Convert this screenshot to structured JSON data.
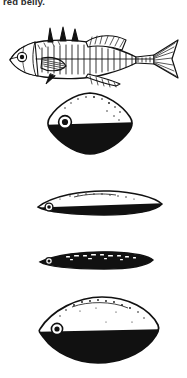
{
  "page": {
    "background_color": "#ffffff",
    "ink_color": "#111111",
    "width": 187,
    "height": 378
  },
  "caption": {
    "text": "red belly.",
    "clipped_at_top": true
  },
  "figure": {
    "panels": [
      {
        "id": "fish-lateral-view",
        "name": "stickleback-lateral-illustration",
        "label": "",
        "style": "line-art",
        "features": [
          "eye",
          "gill-cover",
          "pectoral-fin",
          "dorsal-spines",
          "lateral-scutes",
          "anal-fin",
          "caudal-peduncle-keel",
          "forked-caudal-fin"
        ]
      },
      {
        "id": "body-form-1",
        "name": "rounded-diamond-cross-section",
        "label": "",
        "shape": "rounded-rhomboid",
        "upper_tone": "white",
        "lower_tone": "black",
        "has_eye": true
      },
      {
        "id": "body-form-2",
        "name": "flattened-oval-cross-section",
        "label": "",
        "shape": "flattened-ellipse",
        "upper_tone": "white",
        "lower_tone": "black",
        "has_eye": true
      },
      {
        "id": "body-form-3",
        "name": "slender-dark-cross-section",
        "label": "",
        "shape": "slender-spindle",
        "upper_tone": "black",
        "lower_tone": "black",
        "has_eye": true
      },
      {
        "id": "body-form-4",
        "name": "pointed-lens-cross-section",
        "label": "",
        "shape": "pointed-lens",
        "upper_tone": "white",
        "lower_tone": "black",
        "has_eye": true
      }
    ]
  }
}
